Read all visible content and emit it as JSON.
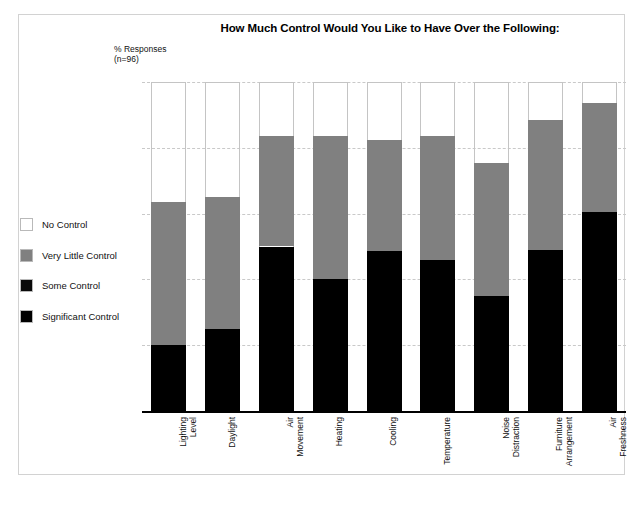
{
  "chart_data": {
    "type": "bar",
    "title": "How Much Control Would You Like to Have Over the Following:",
    "ylabel_line1": "% Responses",
    "ylabel_line2": "(n=96)",
    "xlabel": "",
    "ylim": [
      0,
      100
    ],
    "yticks": [
      0,
      20,
      40,
      60,
      80,
      100
    ],
    "grid": true,
    "stacked": true,
    "legend_position": "left",
    "categories": [
      "Lighting Level",
      "Daylight",
      "Air Movement",
      "Heating",
      "Cooling",
      "Temperature",
      "Noise Distraction",
      "Furniture Arrangement",
      "Air Freshness"
    ],
    "category_lines": [
      [
        "Lighting",
        "Level"
      ],
      [
        "Daylight"
      ],
      [
        "Air",
        "Movement"
      ],
      [
        "Heating"
      ],
      [
        "Cooling"
      ],
      [
        "Temperature"
      ],
      [
        "Noise",
        "Distraction"
      ],
      [
        "Furniture",
        "Arrangement"
      ],
      [
        "Air",
        "Freshness"
      ]
    ],
    "series": [
      {
        "name": "Significant Control",
        "color": "#000000",
        "values": [
          20,
          25,
          50,
          40,
          48.5,
          46,
          35,
          49,
          60.5
        ]
      },
      {
        "name": "Very Little Control",
        "color": "#808080",
        "values": [
          43.5,
          40,
          33.5,
          43.5,
          34,
          37.5,
          40.5,
          39.5,
          33
        ]
      },
      {
        "name": "No Control",
        "color": "#ffffff",
        "values": [
          36.5,
          35,
          16.5,
          16.5,
          17.5,
          16.5,
          24.5,
          11.5,
          6.5
        ]
      }
    ],
    "cumulative_tops": {
      "significant": [
        20,
        25,
        50,
        40,
        48.5,
        46,
        35,
        49,
        60.5
      ],
      "very_little": [
        63.5,
        65,
        83.5,
        83.5,
        82.5,
        83.5,
        75.5,
        88.5,
        93.5
      ],
      "no_control": [
        100,
        100,
        100,
        100,
        100,
        100,
        100,
        100,
        100
      ]
    }
  },
  "legend": {
    "items": [
      {
        "label": "No Control",
        "color": "#ffffff"
      },
      {
        "label": "Very Little Control",
        "color": "#808080"
      },
      {
        "label": "Some Control",
        "color": "#0a0a0a"
      },
      {
        "label": "Significant Control",
        "color": "#000000"
      }
    ]
  },
  "colors": {
    "black": "#000000",
    "gray": "#808080",
    "white": "#ffffff",
    "grid": "#c9c9c9",
    "frame": "#d2d2d2"
  }
}
